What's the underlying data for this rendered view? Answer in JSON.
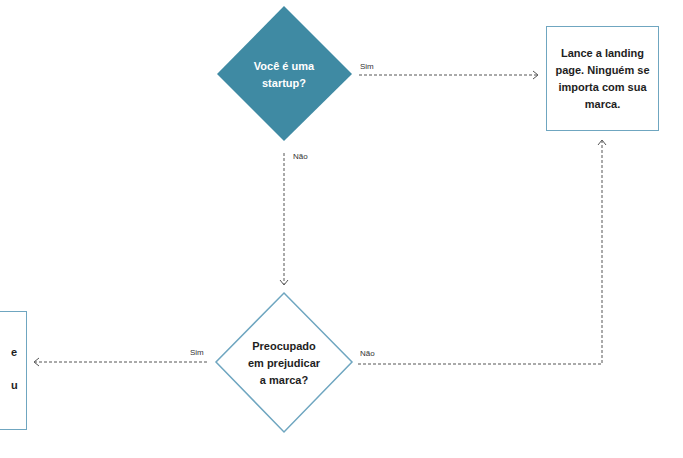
{
  "colors": {
    "primary_fill": "#3f8aa3",
    "outline": "#6fa6c0",
    "connector": "#555555",
    "text_dark": "#1e1e1e",
    "text_light": "#ffffff"
  },
  "nodes": {
    "decision_startup": {
      "shape": "diamond",
      "style": "filled",
      "text_line1": "Você é uma",
      "text_line2": "startup?"
    },
    "decision_brand": {
      "shape": "diamond",
      "style": "outline",
      "text_line1": "Preocupado",
      "text_line2": "em prejudicar",
      "text_line3": "a marca?"
    },
    "result_landing": {
      "shape": "box",
      "text": "Lance a landing page. Ninguém se importa com sua marca."
    },
    "result_left_cropped": {
      "shape": "box",
      "visible_fragments": [
        "e",
        "u"
      ]
    }
  },
  "edges": {
    "startup_yes": {
      "label": "Sim",
      "from": "decision_startup",
      "to": "result_landing"
    },
    "startup_no": {
      "label": "Não",
      "from": "decision_startup",
      "to": "decision_brand"
    },
    "brand_yes": {
      "label": "Sim",
      "from": "decision_brand",
      "to": "result_left_cropped"
    },
    "brand_no": {
      "label": "Não",
      "from": "decision_brand",
      "to": "result_landing"
    }
  }
}
